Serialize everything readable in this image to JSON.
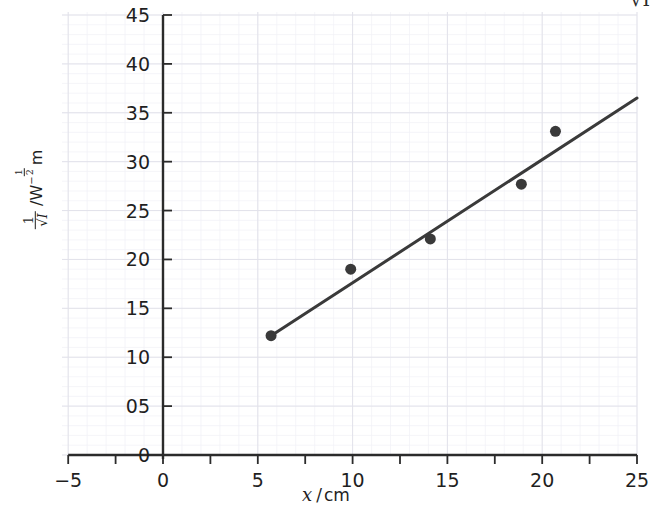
{
  "figure": {
    "width": 652,
    "height": 514,
    "background": "#ffffff",
    "ink_color": "#2b2b2b",
    "grid_major_color": "#e2e2ea",
    "grid_minor_color": "#f1f1f6",
    "cropped_fragment_top_right": "√I"
  },
  "axis_labels": {
    "x": {
      "symbol": "x",
      "separator": "/",
      "unit": "cm",
      "full": "x /cm"
    },
    "y": {
      "numerator": "1",
      "denominator": "√I",
      "separator": "/",
      "unit_base": "W",
      "unit_exponent_sign": "−",
      "unit_exponent_numerator": "1",
      "unit_exponent_denominator": "2",
      "unit_tail": "m",
      "full": "1/√I / W^−1/2 m"
    }
  },
  "chart_data": {
    "type": "scatter",
    "title": "",
    "xlabel": "x /cm",
    "ylabel": "1/√I / W^-1/2 m",
    "xlim": [
      -5,
      25
    ],
    "ylim": [
      0,
      45
    ],
    "xticks": [
      -5,
      0,
      5,
      10,
      15,
      20,
      25
    ],
    "xticklabels": [
      "−5",
      "0",
      "5",
      "10",
      "15",
      "20",
      "25"
    ],
    "xminorticks": [
      -2.5,
      2.5,
      7.5,
      12.5,
      17.5,
      22.5
    ],
    "yticks": [
      0,
      5,
      10,
      15,
      20,
      25,
      30,
      35,
      40,
      45
    ],
    "yticklabels": [
      "0",
      "05",
      "10",
      "15",
      "20",
      "25",
      "30",
      "35",
      "40",
      "45"
    ],
    "grid": true,
    "grid_major_spacing_x": 5,
    "grid_major_spacing_y": 5,
    "legend": null,
    "series": [
      {
        "name": "measurements",
        "type": "scatter",
        "marker": "circle",
        "marker_color": "#3a3a3a",
        "marker_size_px": 11,
        "points": [
          {
            "x": 5.7,
            "y": 12.2
          },
          {
            "x": 9.9,
            "y": 19.0
          },
          {
            "x": 14.1,
            "y": 22.1
          },
          {
            "x": 18.9,
            "y": 27.7
          },
          {
            "x": 20.7,
            "y": 33.1
          }
        ]
      },
      {
        "name": "line-of-best-fit",
        "type": "line",
        "color": "#3a3a3a",
        "width_px": 3,
        "start": {
          "x": 5.7,
          "y": 12.2
        },
        "end": {
          "x": 25.0,
          "y": 36.5
        },
        "slope": 1.259,
        "intercept": 5.02
      }
    ]
  }
}
